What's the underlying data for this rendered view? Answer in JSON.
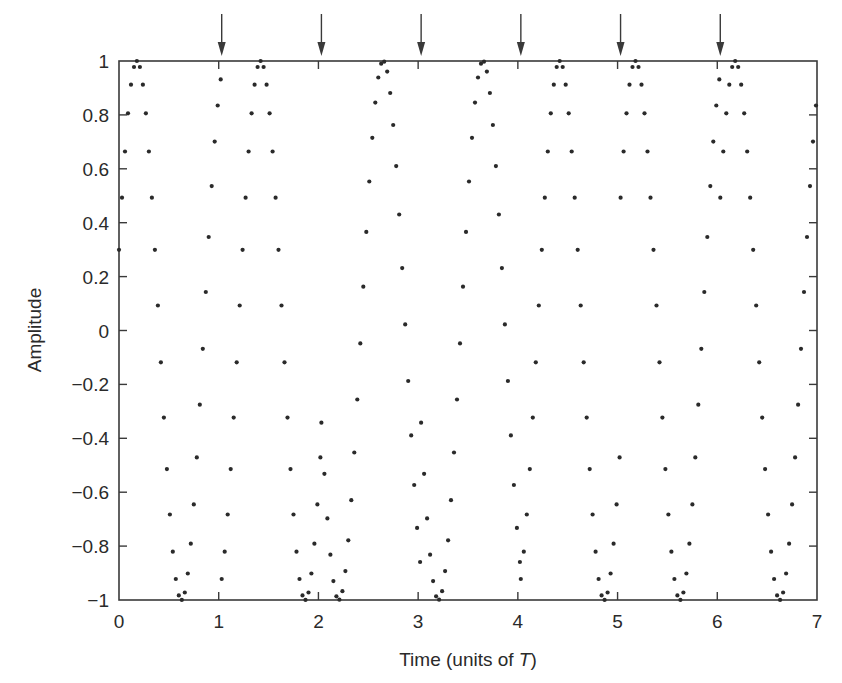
{
  "chart_data": {
    "type": "scatter",
    "title": "",
    "xlabel": "Time (units of T)",
    "xlabel_parts": {
      "prefix": "Time (units of ",
      "italic": "T",
      "suffix": ")"
    },
    "ylabel": "Amplitude",
    "xlim": [
      0,
      7
    ],
    "ylim": [
      -1,
      1
    ],
    "x_ticks": [
      0,
      1,
      2,
      3,
      4,
      5,
      6,
      7
    ],
    "x_tick_labels": [
      "0",
      "1",
      "2",
      "3",
      "4",
      "5",
      "6",
      "7"
    ],
    "y_ticks": [
      1,
      0.8,
      0.6,
      0.4,
      0.2,
      0,
      -0.2,
      -0.4,
      -0.6,
      -0.8,
      -1
    ],
    "y_tick_labels": [
      "1",
      "0.8",
      "0.6",
      "0.4",
      "0.2",
      "0",
      "−0.2",
      "−0.4",
      "−0.6",
      "−0.8",
      "−1"
    ],
    "grid": false,
    "legend": null,
    "marker": "dot",
    "marker_color": "#2a2a2a",
    "sample_spacing_T": 0.03,
    "carrier_frequency_per_T": 1.12,
    "symbol_boundary_arrows_x": [
      1.03,
      2.03,
      3.03,
      4.03,
      5.03,
      6.03
    ],
    "segments": [
      {
        "t_start": 0.0,
        "t_end": 1.03,
        "peak_t": 0.18,
        "value_at_start": 0.75,
        "value_at_end": 0.72
      },
      {
        "t_start": 1.03,
        "t_end": 2.03,
        "peak_t": 1.42,
        "value_at_start": 0.72,
        "value_at_end": -0.72
      },
      {
        "t_start": 2.03,
        "t_end": 3.03,
        "peak_t": 2.65,
        "value_at_start": -0.72,
        "value_at_end": -0.98
      },
      {
        "t_start": 3.03,
        "t_end": 4.03,
        "peak_t": 3.65,
        "value_at_start": -0.98,
        "value_at_end": -0.77
      },
      {
        "t_start": 4.03,
        "t_end": 5.03,
        "peak_t": 4.42,
        "value_at_start": -0.77,
        "value_at_end": -0.72
      },
      {
        "t_start": 5.03,
        "t_end": 6.03,
        "peak_t": 5.18,
        "value_at_start": 0.73,
        "value_at_end": 0.98
      },
      {
        "t_start": 6.03,
        "t_end": 7.0,
        "peak_t": 6.18,
        "value_at_start": 0.98,
        "value_at_end": 0.65
      }
    ],
    "peaks_x": [
      0.18,
      1.42,
      2.65,
      3.65,
      4.42,
      5.18,
      6.18
    ],
    "troughs_x": [
      0.63,
      1.87,
      2.08,
      3.1,
      4.88,
      5.62,
      6.63
    ]
  }
}
